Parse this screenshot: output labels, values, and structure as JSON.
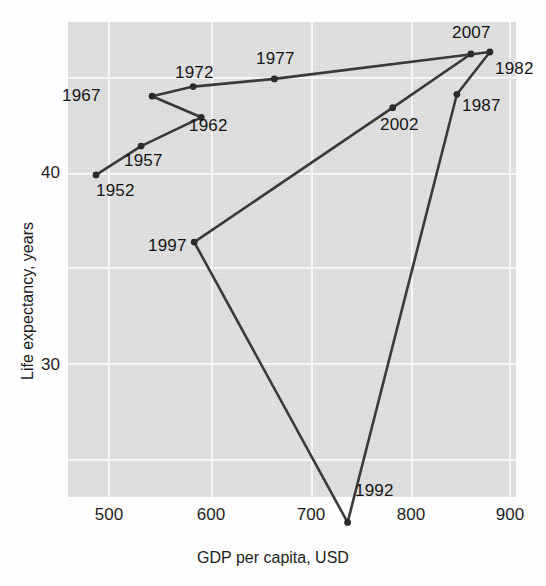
{
  "chart_data": {
    "type": "line",
    "title": "",
    "xlabel": "GDP per capita, USD",
    "ylabel": "Life expectancy, years",
    "xlim": [
      455,
      902
    ],
    "ylim": [
      18.5,
      47.2
    ],
    "xticks": [
      500,
      600,
      700,
      800,
      900
    ],
    "yticks": [
      30,
      40
    ],
    "gridlines_y": [
      20,
      25,
      30,
      35,
      40,
      45
    ],
    "grid": true,
    "legend": "none",
    "series": [
      {
        "name": "Country trajectory",
        "points": [
          {
            "label": "1952",
            "x": 487,
            "y": 39.9
          },
          {
            "label": "1957",
            "x": 532,
            "y": 41.4
          },
          {
            "label": "1962",
            "x": 592,
            "y": 42.9
          },
          {
            "label": "1967",
            "x": 543,
            "y": 44.0
          },
          {
            "label": "1972",
            "x": 584,
            "y": 44.5
          },
          {
            "label": "1977",
            "x": 665,
            "y": 44.9
          },
          {
            "label": "1982",
            "x": 880,
            "y": 46.3
          },
          {
            "label": "1987",
            "x": 847,
            "y": 44.1
          },
          {
            "label": "1992",
            "x": 738,
            "y": 21.8
          },
          {
            "label": "1997",
            "x": 585,
            "y": 36.4
          },
          {
            "label": "2002",
            "x": 783,
            "y": 43.4
          },
          {
            "label": "2007",
            "x": 861,
            "y": 46.2
          }
        ]
      }
    ]
  },
  "axes": {
    "xticklabels": [
      "500",
      "600",
      "700",
      "800",
      "900"
    ],
    "yticklabels": [
      "40",
      "30"
    ],
    "xtitle": "GDP per capita, USD",
    "ytitle": "Life expectancy, years"
  },
  "annotations": [
    {
      "text": "1952",
      "px": 96,
      "py": 192
    },
    {
      "text": "1957",
      "px": 124,
      "py": 162
    },
    {
      "text": "1962",
      "px": 189,
      "py": 127
    },
    {
      "text": "1967",
      "px": 62,
      "py": 97
    },
    {
      "text": "1972",
      "px": 175,
      "py": 74
    },
    {
      "text": "1977",
      "px": 256,
      "py": 60
    },
    {
      "text": "1982",
      "px": 495,
      "py": 70
    },
    {
      "text": "1987",
      "px": 462,
      "py": 107
    },
    {
      "text": "1992",
      "px": 355,
      "py": 492
    },
    {
      "text": "1997",
      "px": 148,
      "py": 247
    },
    {
      "text": "2002",
      "px": 380,
      "py": 126
    },
    {
      "text": "2007",
      "px": 452,
      "py": 34
    }
  ],
  "style": {
    "panel_bg": "#d7d7d7",
    "grid_color": "#f4f4f4",
    "line_color": "#3a3a3a",
    "marker_color": "#2b2b2b",
    "text_color": "#1d1d1d"
  }
}
